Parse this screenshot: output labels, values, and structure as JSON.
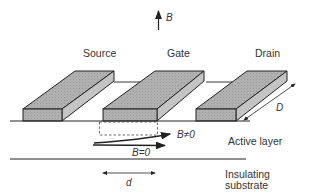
{
  "diagram": {
    "field_label": "B",
    "electrodes": {
      "source": "Source",
      "gate": "Gate",
      "drain": "Drain"
    },
    "dimension_width": "D",
    "dimension_gap": "d",
    "arrow_field_nonzero": "B≠0",
    "arrow_field_zero": "B=0",
    "layers": {
      "active": "Active layer",
      "substrate_line1": "Insulating",
      "substrate_line2": "substrate"
    },
    "colors": {
      "block_fill": "#a9a9a9",
      "line": "#222222"
    }
  }
}
